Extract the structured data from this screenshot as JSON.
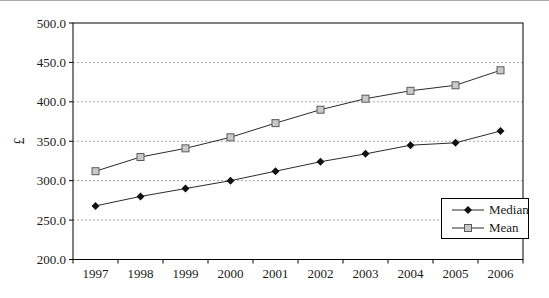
{
  "chart_data": {
    "type": "line",
    "title": "",
    "xlabel": "",
    "ylabel": "£",
    "categories": [
      "1997",
      "1998",
      "1999",
      "2000",
      "2001",
      "2002",
      "2003",
      "2004",
      "2005",
      "2006"
    ],
    "series": [
      {
        "name": "Median",
        "marker": "diamond",
        "values": [
          268,
          280,
          290,
          300,
          312,
          324,
          334,
          345,
          348,
          363
        ]
      },
      {
        "name": "Mean",
        "marker": "square",
        "values": [
          312,
          330,
          341,
          355,
          373,
          390,
          404,
          414,
          421,
          440
        ]
      }
    ],
    "ylim": [
      200,
      500
    ],
    "ytick_step": 50,
    "ytick_format": "one-decimal",
    "grid": "horizontal-dashed",
    "legend_position": "inside-bottom-right"
  },
  "colors": {
    "background": "#ffffff",
    "axis": "#000000",
    "grid": "#a8a8a8",
    "text": "#1a1a1a",
    "series_line": "#2b2b2b",
    "median_marker": "#111111",
    "mean_marker_fill": "#c9c9c9",
    "mean_marker_stroke": "#5a5a5a"
  }
}
